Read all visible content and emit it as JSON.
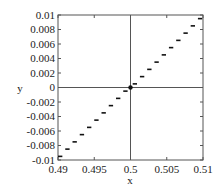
{
  "chart_data": {
    "type": "line",
    "title": "",
    "xlabel": "x",
    "ylabel": "y",
    "xlim": [
      0.49,
      0.51
    ],
    "ylim": [
      -0.01,
      0.01
    ],
    "grid": false,
    "legend": null,
    "x_ticks": [
      0.49,
      0.495,
      0.5,
      0.505,
      0.51
    ],
    "x_tick_labels": [
      "0.49",
      "0.495",
      "0.5",
      "0.505",
      "0.51"
    ],
    "y_ticks": [
      -0.01,
      -0.008,
      -0.006,
      -0.004,
      -0.002,
      0,
      0.002,
      0.004,
      0.006,
      0.008,
      0.01
    ],
    "y_tick_labels": [
      "-0.01",
      "-0.008",
      "-0.006",
      "-0.004",
      "-0.002",
      "0",
      "0.002",
      "0.004",
      "0.006",
      "0.008",
      "0.01"
    ],
    "reference_lines": {
      "x": 0.5,
      "y": 0
    },
    "highlight_point": {
      "x": 0.5,
      "y": 0
    },
    "series": [
      {
        "name": "staircase",
        "style": "short horizontal segments",
        "segments": [
          {
            "x0": 0.49,
            "x1": 0.4906,
            "y": -0.0095
          },
          {
            "x0": 0.491,
            "x1": 0.4916,
            "y": -0.0085
          },
          {
            "x0": 0.492,
            "x1": 0.4926,
            "y": -0.0075
          },
          {
            "x0": 0.493,
            "x1": 0.4936,
            "y": -0.0065
          },
          {
            "x0": 0.494,
            "x1": 0.4946,
            "y": -0.0055
          },
          {
            "x0": 0.495,
            "x1": 0.4956,
            "y": -0.0045
          },
          {
            "x0": 0.496,
            "x1": 0.4966,
            "y": -0.0035
          },
          {
            "x0": 0.497,
            "x1": 0.4976,
            "y": -0.0025
          },
          {
            "x0": 0.498,
            "x1": 0.4986,
            "y": -0.0015
          },
          {
            "x0": 0.499,
            "x1": 0.4996,
            "y": -0.0005
          },
          {
            "x0": 0.5003,
            "x1": 0.5009,
            "y": 0.0005
          },
          {
            "x0": 0.5013,
            "x1": 0.5019,
            "y": 0.0015
          },
          {
            "x0": 0.5023,
            "x1": 0.5029,
            "y": 0.0025
          },
          {
            "x0": 0.5033,
            "x1": 0.5039,
            "y": 0.0035
          },
          {
            "x0": 0.5043,
            "x1": 0.5049,
            "y": 0.0045
          },
          {
            "x0": 0.5053,
            "x1": 0.5059,
            "y": 0.0055
          },
          {
            "x0": 0.5063,
            "x1": 0.5069,
            "y": 0.0065
          },
          {
            "x0": 0.5073,
            "x1": 0.5079,
            "y": 0.0075
          },
          {
            "x0": 0.5083,
            "x1": 0.5089,
            "y": 0.0085
          },
          {
            "x0": 0.5093,
            "x1": 0.5099,
            "y": 0.0095
          }
        ]
      }
    ]
  },
  "colors": {
    "axes": "#555555",
    "data": "#111111",
    "text": "#222222"
  }
}
